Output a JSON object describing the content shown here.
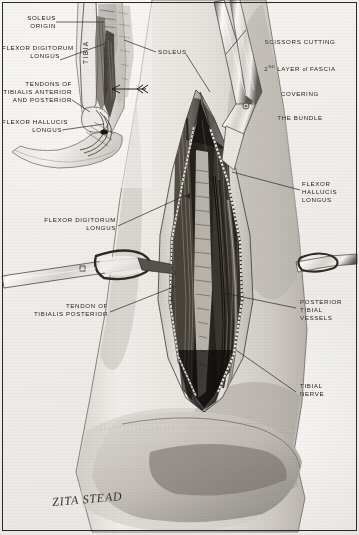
{
  "plate": {
    "title": "Surgical exposure of the posterior tibial neurovascular bundle",
    "signature": "ZITA STEAD",
    "background_color": "#f2f1ee",
    "ink_color": "#23211f",
    "border_color": "#2b2a28"
  },
  "labels": {
    "soleus_origin": "SOLEUS\nORIGIN",
    "flexor_digitorum_longus_inset": "FLEXOR DIGITORUM\nLONGUS",
    "tendons_tib_ant_post": "TENDONS OF\nTIBIALIS ANTERIOR\nAND POSTERIOR",
    "flexor_hallucis_longus_inset": "FLEXOR HALLUCIS\nLONGUS",
    "tibia": "TIBIA",
    "soleus": "SOLEUS",
    "scissors_line1": "SCISSORS CUTTING",
    "scissors_line2_a": "2",
    "scissors_line2_sup": "ND",
    "scissors_line2_b": " LAYER ",
    "scissors_line2_of": "of",
    "scissors_line2_c": " FASCIA",
    "scissors_line3": "COVERING",
    "scissors_line4": "THE BUNDLE",
    "flexor_hallucis_longus_main": "FLEXOR\nHALLUCIS\nLONGUS",
    "flexor_digitorum_longus_main": "FLEXOR DIGITORUM\nLONGUS",
    "tendon_of_tibialis_posterior": "TENDON OF\nTIBIALIS POSTERIOR",
    "posterior_tibial_vessels": "POSTERIOR\nTIBIAL\nVESSELS",
    "tibial_nerve": "TIBIAL\nNERVE"
  },
  "structures": [
    {
      "name": "soleus-origin",
      "region": "inset-upper-tibia"
    },
    {
      "name": "tibia",
      "region": "inset-shaft"
    },
    {
      "name": "flexor-digitorum-longus",
      "region": "inset-and-main-wound"
    },
    {
      "name": "flexor-hallucis-longus",
      "region": "inset-and-main-wound"
    },
    {
      "name": "tendons-tibialis-anterior-posterior",
      "region": "inset-ankle"
    },
    {
      "name": "soleus",
      "region": "main-calf"
    },
    {
      "name": "posterior-tibial-vessels",
      "region": "main-wound-deep"
    },
    {
      "name": "tibial-nerve",
      "region": "main-wound-deep"
    },
    {
      "name": "scissors",
      "region": "main-wound-proximal"
    },
    {
      "name": "artery-forceps",
      "region": "main-wound-mid-left"
    },
    {
      "name": "fascia-second-layer",
      "region": "main-wound"
    }
  ]
}
